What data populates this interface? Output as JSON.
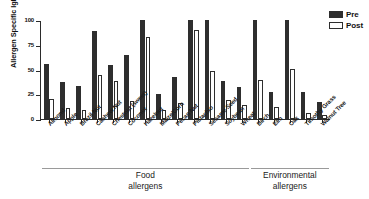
{
  "chart_data": {
    "type": "bar",
    "title": "",
    "xlabel": "",
    "ylabel": "Allergen Specific IgE, kU/L",
    "ylim": [
      0,
      100
    ],
    "yticks": [
      0,
      25,
      50,
      75,
      100
    ],
    "ytick_labels": [
      "0",
      "25",
      "50",
      "75",
      "100"
    ],
    "grid": false,
    "legend_position": "top-right",
    "categories": [
      "Almond",
      "Apple",
      "Brazil Nut",
      "Cashew Nut",
      "Chestnut (sweet)",
      "Coconut",
      "Hazelnut",
      "Maize/Corn",
      "Pecan Nut",
      "Pistachio",
      "Sesame Seed",
      "Soybean",
      "Wheat",
      "Birch",
      "Elm",
      "Oak",
      "Timothy Grass",
      "Walnut Tree"
    ],
    "series": [
      {
        "name": "Pre",
        "color": "#2e2e2e",
        "values": [
          56,
          37,
          33,
          89,
          55,
          65,
          100,
          25,
          42,
          100,
          100,
          38,
          32,
          100,
          27,
          100,
          27,
          17
        ]
      },
      {
        "name": "Post",
        "color": "#ffffff",
        "values": [
          20,
          11,
          9,
          44,
          38,
          18,
          83,
          9,
          16,
          90,
          48,
          19,
          14,
          39,
          12,
          51,
          6,
          4
        ]
      }
    ],
    "groups": [
      {
        "label": "Food\nallergens",
        "line1": "Food",
        "line2": "allergens",
        "start_index": 0,
        "end_index": 12
      },
      {
        "label": "Environmental\nallergens",
        "line1": "Environmental",
        "line2": "allergens",
        "start_index": 13,
        "end_index": 17
      }
    ]
  },
  "legend": {
    "items": [
      {
        "label": "Pre",
        "swatch": "filled-dark"
      },
      {
        "label": "Post",
        "swatch": "outlined-white"
      }
    ]
  },
  "axes": {
    "y_title": "Allergen Specific IgE, kU/L"
  },
  "colors": {
    "pre_bar": "#2e2e2e",
    "post_bar": "#ffffff",
    "axis": "#2b2b2b",
    "group_rule": "#9a9a9a",
    "text": "#1a1a1a",
    "background": "#ffffff"
  }
}
